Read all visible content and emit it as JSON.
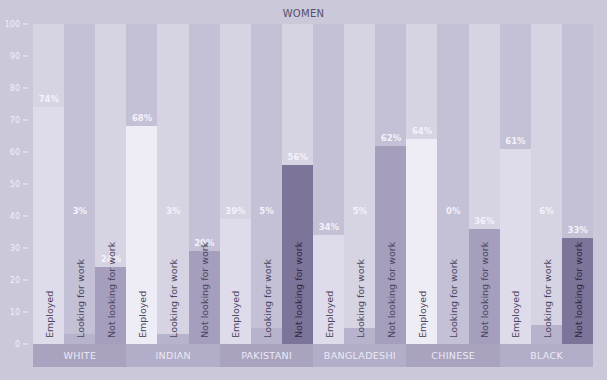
{
  "chart_data": {
    "type": "bar",
    "title": "WOMEN",
    "xlabel": "",
    "ylabel": "",
    "ylim": [
      0,
      100
    ],
    "yticks": [
      0,
      10,
      20,
      30,
      40,
      50,
      60,
      70,
      80,
      90,
      100
    ],
    "grid": false,
    "legend": "none (series labels written inside bars)",
    "categories": [
      "WHITE",
      "INDIAN",
      "PAKISTANI",
      "BANGLADESHI",
      "CHINESE",
      "BLACK"
    ],
    "series": [
      {
        "name": "Employed",
        "values": [
          74,
          68,
          39,
          34,
          64,
          61
        ]
      },
      {
        "name": "Looking for work",
        "values": [
          3,
          3,
          5,
          5,
          0,
          6
        ]
      },
      {
        "name": "Not looking for work",
        "values": [
          24,
          29,
          56,
          62,
          36,
          33
        ]
      }
    ],
    "value_labels": [
      [
        "74%",
        "3%",
        "24%"
      ],
      [
        "68%",
        "3%",
        "29%"
      ],
      [
        "39%",
        "5%",
        "56%"
      ],
      [
        "34%",
        "5%",
        "62%"
      ],
      [
        "64%",
        "0%",
        "36%"
      ],
      [
        "61%",
        "6%",
        "33%"
      ]
    ]
  },
  "colors": {
    "background": "#cbc8d9",
    "track_light": "#d6d3e3",
    "track_dark": "#c4c0d5",
    "employed": "#dedbea",
    "employed_highlight": "#eeecf5",
    "looking": "#b8b3cc",
    "not_looking": "#a59ebd",
    "not_looking_dark": "#7d7499",
    "category_strip": "#a9a3c0",
    "value_label": "#f4f2fa",
    "bar_label": "#4a4560"
  },
  "series_labels": [
    "Employed",
    "Looking for work",
    "Not looking for work"
  ]
}
